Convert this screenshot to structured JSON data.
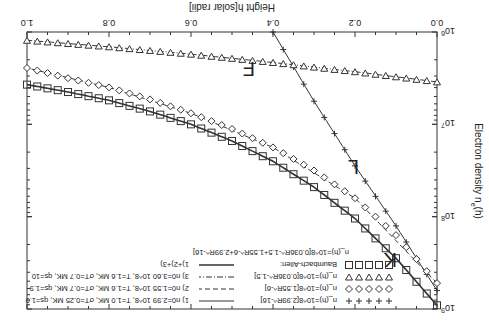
{
  "chart_data": {
    "type": "scatter",
    "orientation_note": "rendered rotated 180 degrees",
    "title": "",
    "xlabel": "Height  h[solar radii]",
    "ylabel": "Electron density  n_e(h)",
    "xlim": [
      0.0,
      1.0
    ],
    "ylim": [
      1000000.0,
      1000000000.0
    ],
    "yscale": "log",
    "xticks": [
      "0.0",
      "0.2",
      "0.4",
      "0.6",
      "0.8",
      "1.0"
    ],
    "yticks": [
      "10^6",
      "10^7",
      "10^8",
      "10^9"
    ],
    "annotations": [
      "K",
      "L",
      "F"
    ],
    "legend_position": "upper right",
    "series": [
      {
        "name": "n_(h)=10^8[2.99R^-16]",
        "marker": "+",
        "x": [
          0.0,
          0.05,
          0.1,
          0.15,
          0.2,
          0.25,
          0.3,
          0.35,
          0.4
        ],
        "log10_y": [
          8.8,
          8.45,
          8.1,
          7.78,
          7.45,
          7.1,
          6.75,
          6.38,
          6.0
        ]
      },
      {
        "name": "n_(h)=10^8[1.55R^-6]",
        "marker": "diamond",
        "x": [
          0.0,
          0.1,
          0.2,
          0.3,
          0.4,
          0.5,
          0.6,
          0.7,
          0.8,
          0.9,
          1.0
        ],
        "log10_y": [
          8.72,
          8.2,
          7.8,
          7.5,
          7.25,
          7.05,
          6.88,
          6.73,
          6.6,
          6.5,
          6.39
        ]
      },
      {
        "name": "n_(h)=10^8[0.036R^-1.5]",
        "marker": "triangle-down",
        "x": [
          0.0,
          0.2,
          0.4,
          0.6,
          0.8,
          1.0
        ],
        "log10_y": [
          6.54,
          6.43,
          6.33,
          6.24,
          6.16,
          6.09
        ]
      },
      {
        "name": "Baumbach-Allen:",
        "marker": "square",
        "x": [
          0.0,
          0.1,
          0.2,
          0.3,
          0.4,
          0.5,
          0.6,
          0.7,
          0.8,
          0.9,
          1.0
        ],
        "log10_y": [
          8.96,
          8.45,
          8.02,
          7.68,
          7.4,
          7.18,
          7.0,
          6.86,
          6.74,
          6.65,
          6.57
        ]
      },
      {
        "name": "1) n_0=2.99 10^8, T_e=1.0 MK, σ_T=0.25 MK, q_s=1.0",
        "style": "solid",
        "x": [
          0.0,
          0.1,
          0.2,
          0.3,
          0.4
        ],
        "log10_y": [
          8.8,
          8.1,
          7.45,
          6.75,
          6.0
        ]
      },
      {
        "name": "2) n_0=1.55 10^8, T_e=1.6 MK, σ_T=0.7 MK, q_s=1.9",
        "style": "dashed",
        "x": [
          0.0,
          0.2,
          0.4,
          0.6,
          0.8,
          1.0
        ],
        "log10_y": [
          8.72,
          7.8,
          7.25,
          6.88,
          6.6,
          6.39
        ]
      },
      {
        "name": "3) n_0=3.60 10^8, T_e=1.6 MK, σ_T=0.7 MK, q_s=10",
        "style": "dash-dot",
        "x": [
          0.0,
          0.2,
          0.4,
          0.6,
          0.8,
          1.0
        ],
        "log10_y": [
          6.54,
          6.43,
          6.33,
          6.24,
          6.16,
          6.09
        ]
      },
      {
        "name": "1)+2)+3)",
        "style": "thick-solid",
        "x": [
          0.0,
          0.1,
          0.2,
          0.3,
          0.4,
          0.5,
          0.6,
          0.7,
          0.8,
          0.9,
          1.0
        ],
        "log10_y": [
          8.96,
          8.45,
          8.02,
          7.68,
          7.4,
          7.18,
          7.0,
          6.86,
          6.74,
          6.65,
          6.57
        ]
      }
    ],
    "legend_note": "n_(h)=10^8[0.036R^-1.5+1.55R^-6+2.99R^-16]"
  },
  "labels": {
    "xlabel": "Height  h[solar radii]",
    "ylabel": "Electron density  n",
    "ylabel_sub": "e",
    "ylabel_tail": "(h)",
    "xticks": [
      "0.0",
      "0.2",
      "0.4",
      "0.6",
      "0.8",
      "1.0"
    ],
    "yticks": [
      "6",
      "7",
      "8",
      "9"
    ],
    "ybase": "10",
    "K": "K",
    "L": "L",
    "F": "F",
    "legend": {
      "plus": "n_(h)=10^8[2.99R^-16]",
      "diamond": "n_(h)=10^8[1.55R^-6]",
      "triangle": "n_(h)=10^8[0.036R^-1.5]",
      "square": "Baumbach-Allen:",
      "square_sub": "n_(h)=10^8[0.036R^-1.5+1.55R^-6+2.99R^-16]",
      "l1": "1) n0=2.99 10^8, T=1.0 MK, σT=0.25 MK, qs=1.0",
      "l2": "2) n0=1.55 10^8, T=1.6 MK, σT=0.7 MK, qs=1.9",
      "l3": "3) n0=3.60 10^8, T=1.6 MK, σT=0.7 MK, qs=10",
      "l4": "1)+2)+3)"
    }
  }
}
